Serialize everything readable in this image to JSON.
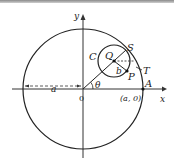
{
  "diagram": {
    "type": "geometry",
    "labels": {
      "y_axis": "y",
      "x_axis": "x",
      "origin": "0",
      "radius_big": "a",
      "theta": "θ",
      "C": "C",
      "Q": "Q",
      "S": "S",
      "T": "T",
      "P": "P",
      "A": "A",
      "b": "b",
      "point_a0": "(a, 0)"
    },
    "colors": {
      "stroke": "#222222",
      "background": "#ffffff"
    }
  }
}
